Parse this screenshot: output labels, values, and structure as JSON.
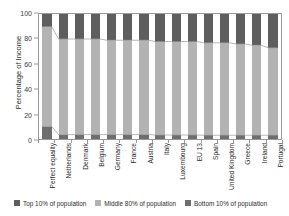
{
  "chart_data": {
    "type": "bar",
    "title": "",
    "subtitle": "",
    "stacked": true,
    "stack_total": 100,
    "xlabel": "",
    "ylabel": "Percentage of Income",
    "ylim": [
      0,
      100
    ],
    "yticks": [
      0,
      20,
      40,
      60,
      80,
      100
    ],
    "grid": false,
    "legend_position": "bottom",
    "categories": [
      "Perfect equality",
      "Netherlands",
      "Denmark",
      "Belgium",
      "Germany",
      "France",
      "Austria",
      "Italy",
      "Luxembourg",
      "EU 13",
      "Spain",
      "United Kingdom",
      "Greece",
      "Ireland",
      "Portugal"
    ],
    "series": [
      {
        "name": "Top 10% of population",
        "color": "#5e5e5e",
        "values": [
          10,
          20,
          20,
          20,
          21,
          21,
          21,
          22,
          22,
          22,
          23,
          23,
          24,
          25,
          27
        ]
      },
      {
        "name": "Middle 80% of population",
        "color": "#b3b3b3",
        "values": [
          80,
          76.5,
          76.5,
          76.5,
          75.5,
          75.5,
          75.5,
          74.8,
          74.8,
          74.8,
          74,
          74,
          73,
          72,
          70
        ]
      },
      {
        "name": "Bottom 10% of population",
        "color": "#6e6e6e",
        "values": [
          10,
          3.5,
          3.5,
          3.5,
          3.5,
          3.5,
          3.5,
          3.2,
          3.2,
          3.2,
          3,
          3,
          3,
          3,
          3
        ]
      }
    ]
  },
  "legend": {
    "items": [
      {
        "label": "Top 10% of population",
        "color": "#5e5e5e"
      },
      {
        "label": "Middle 80% of population",
        "color": "#b3b3b3"
      },
      {
        "label": "Bottom 10% of population",
        "color": "#6e6e6e"
      }
    ]
  }
}
